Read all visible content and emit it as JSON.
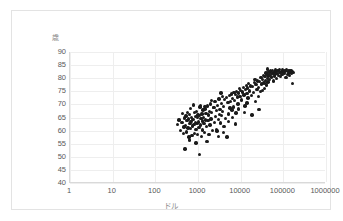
{
  "chart_data": {
    "type": "scatter",
    "title": "",
    "xlabel": "ドル",
    "ylabel": "歳",
    "xscale": "log",
    "yscale": "linear",
    "xlim": [
      1,
      1000000
    ],
    "ylim": [
      40,
      90
    ],
    "xticks": [
      "1",
      "10",
      "100",
      "1000",
      "10000",
      "100000",
      "1000000"
    ],
    "xtick_values": [
      1,
      10,
      100,
      1000,
      10000,
      100000,
      1000000
    ],
    "yticks": [
      "90",
      "85",
      "80",
      "75",
      "70",
      "65",
      "60",
      "55",
      "50",
      "45",
      "40"
    ],
    "ytick_values": [
      90,
      85,
      80,
      75,
      70,
      65,
      60,
      55,
      50,
      45,
      40
    ],
    "grid": true,
    "legend": false,
    "marker_color": "#1a1a1a",
    "marker_shape": "circle",
    "point_count": 186,
    "series": [
      {
        "name": "countries",
        "points": [
          [
            330,
            62.3
          ],
          [
            360,
            64.0
          ],
          [
            395,
            60.1
          ],
          [
            420,
            63.2
          ],
          [
            440,
            66.5
          ],
          [
            455,
            58.9
          ],
          [
            470,
            61.4
          ],
          [
            480,
            64.8
          ],
          [
            495,
            53.0
          ],
          [
            510,
            62.0
          ],
          [
            520,
            65.6
          ],
          [
            535,
            59.5
          ],
          [
            550,
            63.8
          ],
          [
            565,
            67.0
          ],
          [
            580,
            61.0
          ],
          [
            600,
            64.4
          ],
          [
            615,
            57.5
          ],
          [
            630,
            66.2
          ],
          [
            645,
            62.7
          ],
          [
            660,
            68.5
          ],
          [
            675,
            60.8
          ],
          [
            690,
            63.5
          ],
          [
            700,
            65.0
          ],
          [
            720,
            58.2
          ],
          [
            740,
            61.7
          ],
          [
            760,
            64.2
          ],
          [
            780,
            69.8
          ],
          [
            800,
            62.4
          ],
          [
            820,
            66.8
          ],
          [
            840,
            59.0
          ],
          [
            860,
            63.0
          ],
          [
            880,
            65.3
          ],
          [
            900,
            60.5
          ],
          [
            920,
            67.4
          ],
          [
            940,
            62.8
          ],
          [
            960,
            64.9
          ],
          [
            980,
            58.6
          ],
          [
            1000,
            66.0
          ],
          [
            1020,
            63.3
          ],
          [
            1050,
            61.2
          ],
          [
            1080,
            50.8
          ],
          [
            1100,
            65.8
          ],
          [
            1120,
            69.0
          ],
          [
            1150,
            62.1
          ],
          [
            1180,
            64.6
          ],
          [
            1200,
            57.8
          ],
          [
            1230,
            66.4
          ],
          [
            1260,
            63.7
          ],
          [
            1290,
            60.2
          ],
          [
            1320,
            67.8
          ],
          [
            1350,
            65.1
          ],
          [
            1380,
            62.6
          ],
          [
            1400,
            59.3
          ],
          [
            1450,
            68.2
          ],
          [
            1500,
            64.0
          ],
          [
            1550,
            66.6
          ],
          [
            1600,
            61.5
          ],
          [
            1650,
            69.4
          ],
          [
            1700,
            63.9
          ],
          [
            1750,
            65.9
          ],
          [
            1800,
            58.4
          ],
          [
            1850,
            67.2
          ],
          [
            1900,
            62.2
          ],
          [
            1950,
            70.1
          ],
          [
            2000,
            64.5
          ],
          [
            2100,
            66.9
          ],
          [
            2200,
            60.0
          ],
          [
            2300,
            68.8
          ],
          [
            2400,
            63.1
          ],
          [
            2500,
            71.2
          ],
          [
            2600,
            65.4
          ],
          [
            2700,
            67.6
          ],
          [
            2800,
            59.8
          ],
          [
            2900,
            69.6
          ],
          [
            3000,
            64.3
          ],
          [
            3100,
            72.0
          ],
          [
            3200,
            66.1
          ],
          [
            3300,
            68.0
          ],
          [
            3400,
            62.9
          ],
          [
            3500,
            70.4
          ],
          [
            3600,
            65.7
          ],
          [
            3700,
            73.0
          ],
          [
            3800,
            67.3
          ],
          [
            3900,
            59.2
          ],
          [
            4000,
            69.2
          ],
          [
            4200,
            71.8
          ],
          [
            4400,
            64.7
          ],
          [
            4600,
            72.6
          ],
          [
            4800,
            57.6
          ],
          [
            5000,
            70.8
          ],
          [
            5200,
            66.3
          ],
          [
            5400,
            73.4
          ],
          [
            5600,
            68.6
          ],
          [
            5800,
            71.0
          ],
          [
            6000,
            74.0
          ],
          [
            6200,
            67.8
          ],
          [
            6500,
            72.2
          ],
          [
            6800,
            69.0
          ],
          [
            7000,
            74.6
          ],
          [
            7200,
            71.5
          ],
          [
            7500,
            73.8
          ],
          [
            7800,
            66.7
          ],
          [
            8000,
            75.0
          ],
          [
            8300,
            72.8
          ],
          [
            8600,
            70.2
          ],
          [
            9000,
            74.3
          ],
          [
            9300,
            76.0
          ],
          [
            9600,
            73.1
          ],
          [
            10000,
            75.4
          ],
          [
            10500,
            71.7
          ],
          [
            11000,
            74.8
          ],
          [
            11500,
            76.5
          ],
          [
            12000,
            73.6
          ],
          [
            12500,
            69.4
          ],
          [
            13000,
            75.8
          ],
          [
            13500,
            77.2
          ],
          [
            14000,
            74.1
          ],
          [
            14500,
            76.2
          ],
          [
            15000,
            72.4
          ],
          [
            15500,
            78.0
          ],
          [
            16000,
            75.1
          ],
          [
            17000,
            77.0
          ],
          [
            18000,
            73.3
          ],
          [
            19000,
            76.8
          ],
          [
            20000,
            74.5
          ],
          [
            21000,
            78.4
          ],
          [
            22000,
            71.0
          ],
          [
            23000,
            77.5
          ],
          [
            24000,
            75.6
          ],
          [
            25000,
            79.0
          ],
          [
            26000,
            76.4
          ],
          [
            27000,
            68.0
          ],
          [
            28000,
            78.8
          ],
          [
            29000,
            74.9
          ],
          [
            30000,
            80.2
          ],
          [
            31000,
            77.8
          ],
          [
            32000,
            75.3
          ],
          [
            33000,
            79.6
          ],
          [
            34000,
            81.0
          ],
          [
            35000,
            78.2
          ],
          [
            36000,
            76.0
          ],
          [
            37000,
            80.6
          ],
          [
            38000,
            79.2
          ],
          [
            39000,
            82.0
          ],
          [
            40000,
            77.4
          ],
          [
            41000,
            81.4
          ],
          [
            42000,
            79.8
          ],
          [
            43000,
            83.5
          ],
          [
            44000,
            78.6
          ],
          [
            45000,
            80.9
          ],
          [
            46000,
            82.4
          ],
          [
            47000,
            81.2
          ],
          [
            48000,
            79.4
          ],
          [
            50000,
            82.8
          ],
          [
            52000,
            80.4
          ],
          [
            54000,
            81.8
          ],
          [
            56000,
            83.0
          ],
          [
            58000,
            79.0
          ],
          [
            60000,
            82.2
          ],
          [
            62000,
            80.8
          ],
          [
            64000,
            81.6
          ],
          [
            66000,
            83.2
          ],
          [
            68000,
            82.6
          ],
          [
            70000,
            80.0
          ],
          [
            72000,
            81.9
          ],
          [
            75000,
            82.9
          ],
          [
            78000,
            81.1
          ],
          [
            80000,
            83.4
          ],
          [
            83000,
            82.1
          ],
          [
            86000,
            80.6
          ],
          [
            90000,
            82.5
          ],
          [
            93000,
            81.3
          ],
          [
            96000,
            83.1
          ],
          [
            100000,
            82.3
          ],
          [
            105000,
            81.7
          ],
          [
            110000,
            82.7
          ],
          [
            115000,
            80.3
          ],
          [
            120000,
            83.3
          ],
          [
            125000,
            81.5
          ],
          [
            130000,
            82.0
          ],
          [
            135000,
            82.8
          ],
          [
            140000,
            81.0
          ],
          [
            145000,
            82.4
          ],
          [
            150000,
            83.0
          ],
          [
            155000,
            81.8
          ],
          [
            160000,
            82.6
          ],
          [
            165000,
            78.0
          ],
          [
            170000,
            82.2
          ],
          [
            2050,
            71.4
          ],
          [
            4100,
            61.6
          ],
          [
            6400,
            65.0
          ],
          [
            3050,
            57.8
          ],
          [
            1470,
            69.2
          ],
          [
            2750,
            60.4
          ],
          [
            18500,
            66.0
          ],
          [
            8900,
            68.2
          ],
          [
            14200,
            70.6
          ],
          [
            26500,
            73.0
          ],
          [
            5100,
            63.4
          ],
          [
            2350,
            68.9
          ],
          [
            12200,
            67.0
          ],
          [
            21500,
            79.4
          ],
          [
            1620,
            55.8
          ],
          [
            900,
            55.2
          ],
          [
            7600,
            62.5
          ],
          [
            3450,
            74.4
          ],
          [
            1150,
            69.6
          ],
          [
            640,
            56.4
          ]
        ]
      }
    ]
  }
}
